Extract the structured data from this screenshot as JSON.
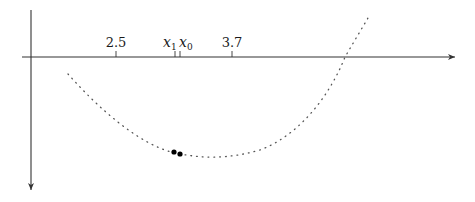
{
  "diagram": {
    "colors": {
      "axis": "#333333",
      "curve": "#555555",
      "point": "#000000",
      "background": "#ffffff"
    },
    "axes": {
      "horizontal": {
        "x1": 22,
        "y": 57,
        "x2": 455,
        "arrow": "right"
      },
      "vertical": {
        "x": 31,
        "y1": 10,
        "y2": 190,
        "arrow": "down"
      }
    },
    "ticks": [
      {
        "id": "tick-2-5",
        "x": 116,
        "label": "2.5",
        "type": "number"
      },
      {
        "id": "tick-x1",
        "x": 175,
        "label": "x",
        "sub": "1",
        "type": "variable"
      },
      {
        "id": "tick-x0",
        "x": 180,
        "label": "x",
        "sub": "0",
        "type": "variable"
      },
      {
        "id": "tick-3-7",
        "x": 232,
        "label": "3.7",
        "type": "number"
      }
    ],
    "curve": {
      "style": "dotted",
      "start": [
        68,
        74
      ],
      "minimum": [
        200,
        157
      ],
      "axis_crossing_x": 345,
      "end": [
        368,
        18
      ]
    },
    "points": [
      {
        "id": "point-x1",
        "cx": 174,
        "cy": 152,
        "r": 2.6
      },
      {
        "id": "point-x0",
        "cx": 180,
        "cy": 154,
        "r": 2.6
      }
    ]
  },
  "labels": {
    "tick_2_5": "2.5",
    "tick_3_7": "3.7",
    "x1_main": "x",
    "x1_sub": "1",
    "x0_main": "x",
    "x0_sub": "0"
  }
}
